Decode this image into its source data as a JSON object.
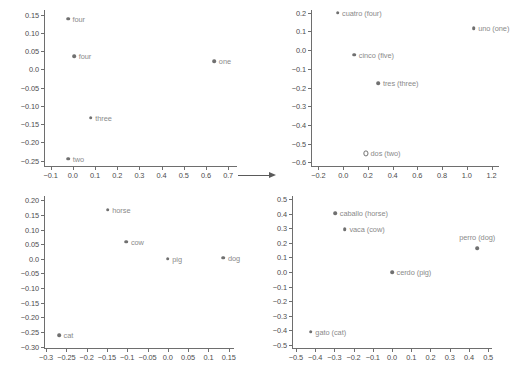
{
  "figure": {
    "width": 518,
    "height": 373,
    "background": "#ffffff",
    "marker_color": "#707070",
    "label_color": "#8a8a8a",
    "axis_color": "#6e6e6e",
    "tick_label_color": "#4d4d4d"
  },
  "connector": {
    "name": "right-arrow",
    "glyph": "→"
  },
  "chart_data": [
    {
      "id": "english-numbers",
      "type": "scatter",
      "title": "",
      "xlabel": "",
      "ylabel": "",
      "xlim": [
        -0.13,
        0.74
      ],
      "ylim": [
        -0.265,
        0.163
      ],
      "grid": false,
      "legend": "none",
      "xticks": [
        -0.1,
        0.0,
        0.1,
        0.2,
        0.3,
        0.4,
        0.5,
        0.6,
        0.7
      ],
      "xticklabels": [
        "−0.1",
        "0.0",
        "0.1",
        "0.2",
        "0.3",
        "0.4",
        "0.5",
        "0.6",
        "0.7"
      ],
      "yticks": [
        0.15,
        0.1,
        0.05,
        0.0,
        -0.05,
        -0.1,
        -0.15,
        -0.2,
        -0.25
      ],
      "yticklabels": [
        "0.15",
        "0.10",
        "0.05",
        "0.0",
        "−0.05",
        "−0.10",
        "−0.15",
        "−0.20",
        "−0.25"
      ],
      "points": [
        {
          "label": "four",
          "x": -0.022,
          "y": 0.139,
          "marker": "filled",
          "label_pos": "right"
        },
        {
          "label": "four",
          "x": 0.006,
          "y": 0.036,
          "marker": "filled",
          "label_pos": "right"
        },
        {
          "label": "one",
          "x": 0.638,
          "y": 0.023,
          "marker": "filled",
          "label_pos": "right"
        },
        {
          "label": "three",
          "x": 0.081,
          "y": -0.132,
          "marker": "filled",
          "label_pos": "right"
        },
        {
          "label": "two",
          "x": -0.021,
          "y": -0.245,
          "marker": "filled",
          "label_pos": "right"
        }
      ]
    },
    {
      "id": "spanish-numbers",
      "type": "scatter",
      "title": "",
      "xlabel": "",
      "ylabel": "",
      "xlim": [
        -0.26,
        1.26
      ],
      "ylim": [
        -0.62,
        0.215
      ],
      "grid": false,
      "legend": "none",
      "xticks": [
        -0.2,
        0.0,
        0.2,
        0.4,
        0.6,
        0.8,
        1.0,
        1.2
      ],
      "xticklabels": [
        "−0.2",
        "0.0",
        "0.2",
        "0.4",
        "0.6",
        "0.8",
        "1.0",
        "1.2"
      ],
      "yticks": [
        0.2,
        0.1,
        0.0,
        -0.1,
        -0.2,
        -0.3,
        -0.4,
        -0.5,
        -0.6
      ],
      "yticklabels": [
        "0.2",
        "0.1",
        "0.0",
        "−0.1",
        "−0.2",
        "−0.3",
        "−0.4",
        "−0.5",
        "−0.6"
      ],
      "points": [
        {
          "label": "cuatro (four)",
          "x": -0.045,
          "y": 0.201,
          "marker": "filled",
          "label_pos": "right"
        },
        {
          "label": "uno (one)",
          "x": 1.055,
          "y": 0.119,
          "marker": "filled",
          "label_pos": "right"
        },
        {
          "label": "cinco (five)",
          "x": 0.09,
          "y": -0.024,
          "marker": "filled",
          "label_pos": "right"
        },
        {
          "label": "tres (three)",
          "x": 0.285,
          "y": -0.177,
          "marker": "filled",
          "label_pos": "right"
        },
        {
          "label": "dos (two)",
          "x": 0.185,
          "y": -0.553,
          "marker": "hollow",
          "label_pos": "right"
        }
      ]
    },
    {
      "id": "english-animals",
      "type": "scatter",
      "title": "",
      "xlabel": "",
      "ylabel": "",
      "xlim": [
        -0.305,
        0.163
      ],
      "ylim": [
        -0.305,
        0.215
      ],
      "grid": false,
      "legend": "none",
      "xticks": [
        -0.3,
        -0.25,
        -0.2,
        -0.15,
        -0.1,
        -0.05,
        0.0,
        0.05,
        0.1,
        0.15
      ],
      "xticklabels": [
        "−0.3",
        "−0.25",
        "−0.2",
        "−0.15",
        "−0.1",
        "−0.05",
        "0.0",
        "0.05",
        "0.1",
        "0.15"
      ],
      "yticks": [
        0.2,
        0.15,
        0.1,
        0.05,
        0.0,
        -0.05,
        -0.1,
        -0.15,
        -0.2,
        -0.25,
        -0.3
      ],
      "yticklabels": [
        "0.20",
        "0.15",
        "0.10",
        "0.05",
        "0.0",
        "−0.05",
        "−0.10",
        "−0.15",
        "−0.20",
        "−0.25",
        "−0.30"
      ],
      "points": [
        {
          "label": "horse",
          "x": -0.148,
          "y": 0.168,
          "marker": "filled",
          "label_pos": "right"
        },
        {
          "label": "cow",
          "x": -0.102,
          "y": 0.059,
          "marker": "filled",
          "label_pos": "right"
        },
        {
          "label": "pig",
          "x": 0.0,
          "y": 0.0,
          "marker": "filled",
          "label_pos": "right"
        },
        {
          "label": "dog",
          "x": 0.137,
          "y": 0.004,
          "marker": "filled",
          "label_pos": "right"
        },
        {
          "label": "cat",
          "x": -0.268,
          "y": -0.261,
          "marker": "filled",
          "label_pos": "right"
        }
      ]
    },
    {
      "id": "spanish-animals",
      "type": "scatter",
      "title": "",
      "xlabel": "",
      "ylabel": "",
      "xlim": [
        -0.52,
        0.52
      ],
      "ylim": [
        -0.52,
        0.52
      ],
      "grid": false,
      "legend": "none",
      "xticks": [
        -0.5,
        -0.4,
        -0.3,
        -0.2,
        -0.1,
        0.0,
        0.1,
        0.2,
        0.3,
        0.4,
        0.5
      ],
      "xticklabels": [
        "−0.5",
        "−0.4",
        "−0.3",
        "−0.2",
        "−0.1",
        "0.0",
        "0.1",
        "0.2",
        "0.3",
        "0.4",
        "0.5"
      ],
      "yticks": [
        0.5,
        0.4,
        0.3,
        0.2,
        0.1,
        0.0,
        -0.1,
        -0.2,
        -0.3,
        -0.4,
        -0.5
      ],
      "yticklabels": [
        "0.5",
        "0.4",
        "0.3",
        "0.2",
        "0.1",
        "0.0",
        "−0.1",
        "−0.2",
        "−0.3",
        "−0.4",
        "−0.5"
      ],
      "points": [
        {
          "label": "caballo (horse)",
          "x": -0.295,
          "y": 0.402,
          "marker": "filled",
          "label_pos": "right"
        },
        {
          "label": "vaca (cow)",
          "x": -0.245,
          "y": 0.291,
          "marker": "filled",
          "label_pos": "right"
        },
        {
          "label": "perro (dog)",
          "x": 0.443,
          "y": 0.163,
          "marker": "filled",
          "label_pos": "above"
        },
        {
          "label": "cerdo (pig)",
          "x": 0.0,
          "y": 0.0,
          "marker": "filled",
          "label_pos": "right"
        },
        {
          "label": "gato (cat)",
          "x": -0.422,
          "y": -0.408,
          "marker": "filled",
          "label_pos": "right"
        }
      ]
    }
  ]
}
